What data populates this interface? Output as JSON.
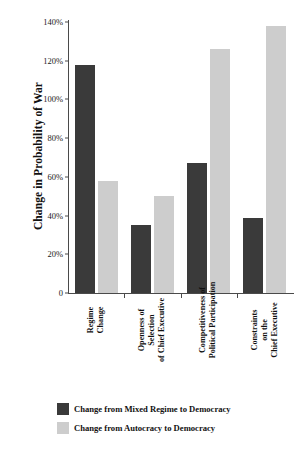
{
  "chart_data": {
    "type": "bar",
    "title": "",
    "subtitle": "",
    "xlabel": "",
    "ylabel": "Change in Probability of War",
    "ylim": [
      0,
      140
    ],
    "yticks": [
      0,
      20,
      40,
      60,
      80,
      100,
      120,
      140
    ],
    "ytick_labels": [
      "0",
      "20%",
      "40%",
      "60%",
      "80%",
      "100%",
      "120%",
      "140%"
    ],
    "grid": false,
    "legend_position": "bottom-left",
    "categories": [
      "Regime\nChange",
      "Openness of\nSelection\nof Chief Executive",
      "Competitiveness of\nPolitical Participation",
      "Constraints\non the\nChief Executive"
    ],
    "category_lines": [
      [
        "Regime",
        "Change"
      ],
      [
        "Openness of",
        "Selection",
        "of Chief Executive"
      ],
      [
        "Competitiveness of",
        "Political Participation"
      ],
      [
        "Constraints",
        "on the",
        "Chief Executive"
      ]
    ],
    "series": [
      {
        "name": "Change from Mixed Regime to Democracy",
        "color": "#3a3a3a",
        "values": [
          118,
          35,
          67,
          39
        ]
      },
      {
        "name": "Change from Autocracy to Democracy",
        "color": "#cdcdcd",
        "values": [
          58,
          50,
          126,
          138
        ]
      }
    ]
  },
  "legend": {
    "items": [
      {
        "label": "Change from Mixed Regime to Democracy",
        "swatch": "dark"
      },
      {
        "label": "Change from Autocracy to Democracy",
        "swatch": "light"
      }
    ]
  }
}
